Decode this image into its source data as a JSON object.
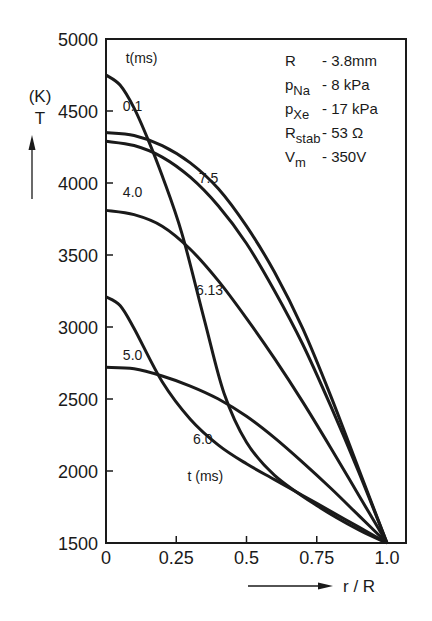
{
  "chart_data": {
    "type": "line",
    "title": "",
    "xlabel": "r / R",
    "ylabel": "T",
    "yunit": "(K)",
    "xlim": [
      0,
      1.0
    ],
    "ylim": [
      1500,
      5000
    ],
    "xticks": [
      "0",
      "0.25",
      "0.5",
      "0.75",
      "1.0"
    ],
    "yticks": [
      "1500",
      "2000",
      "2500",
      "3000",
      "3500",
      "4000",
      "4500",
      "5000"
    ],
    "grid": false,
    "legend_title_top": "t (ms)",
    "legend_title_bottom": "t (ms)",
    "params": [
      {
        "name": "R",
        "sub": "",
        "value": "- 3.8mm"
      },
      {
        "name": "p",
        "sub": "Na",
        "value": "- 8  kPa"
      },
      {
        "name": "p",
        "sub": "Xe",
        "value": "- 17 kPa"
      },
      {
        "name": "R",
        "sub": "stab",
        "value": "- 53 Ω"
      },
      {
        "name": "V",
        "sub": "m",
        "value": "- 350V"
      }
    ],
    "series": [
      {
        "name": "6.13",
        "x": [
          0,
          0.05,
          0.1,
          0.15,
          0.2,
          0.27,
          0.35,
          0.42,
          0.5,
          0.6,
          0.75,
          0.9,
          1.0
        ],
        "y": [
          4750,
          4680,
          4520,
          4300,
          4050,
          3650,
          3050,
          2540,
          2200,
          1970,
          1760,
          1590,
          1500
        ]
      },
      {
        "name": "0.1",
        "x": [
          0,
          0.1,
          0.2,
          0.3,
          0.4,
          0.5,
          0.6,
          0.7,
          0.8,
          0.9,
          1.0
        ],
        "y": [
          4350,
          4330,
          4260,
          4140,
          3960,
          3700,
          3380,
          2990,
          2520,
          2010,
          1500
        ]
      },
      {
        "name": "7.5",
        "x": [
          0,
          0.1,
          0.2,
          0.3,
          0.4,
          0.5,
          0.6,
          0.7,
          0.8,
          0.9,
          1.0
        ],
        "y": [
          4290,
          4260,
          4180,
          4040,
          3840,
          3580,
          3250,
          2880,
          2450,
          1990,
          1500
        ]
      },
      {
        "name": "4.0",
        "x": [
          0,
          0.1,
          0.2,
          0.3,
          0.4,
          0.5,
          0.6,
          0.7,
          0.8,
          0.9,
          1.0
        ],
        "y": [
          3810,
          3780,
          3700,
          3540,
          3320,
          3060,
          2780,
          2480,
          2160,
          1830,
          1500
        ]
      },
      {
        "name": "6.0",
        "x": [
          0,
          0.05,
          0.1,
          0.2,
          0.3,
          0.4,
          0.5,
          0.6,
          0.7,
          0.8,
          0.9,
          1.0
        ],
        "y": [
          3210,
          3150,
          2990,
          2620,
          2360,
          2180,
          2050,
          1940,
          1830,
          1720,
          1610,
          1500
        ]
      },
      {
        "name": "5.0",
        "x": [
          0,
          0.1,
          0.2,
          0.3,
          0.4,
          0.5,
          0.6,
          0.7,
          0.8,
          0.9,
          1.0
        ],
        "y": [
          2720,
          2710,
          2660,
          2590,
          2500,
          2380,
          2230,
          2060,
          1880,
          1690,
          1500
        ]
      }
    ],
    "curve_labels": [
      {
        "text": "0.1",
        "r": 0.06,
        "T": 4500
      },
      {
        "text": "7.5",
        "r": 0.33,
        "T": 4000
      },
      {
        "text": "4.0",
        "r": 0.06,
        "T": 3900
      },
      {
        "text": "6.13",
        "r": 0.32,
        "T": 3220
      },
      {
        "text": "5.0",
        "r": 0.06,
        "T": 2770
      },
      {
        "text": "6.0",
        "r": 0.31,
        "T": 2190
      },
      {
        "text": "t (ms)",
        "r": 0.29,
        "T": 1930
      },
      {
        "text": "t(ms)",
        "r": 0.07,
        "T": 4830
      }
    ]
  }
}
